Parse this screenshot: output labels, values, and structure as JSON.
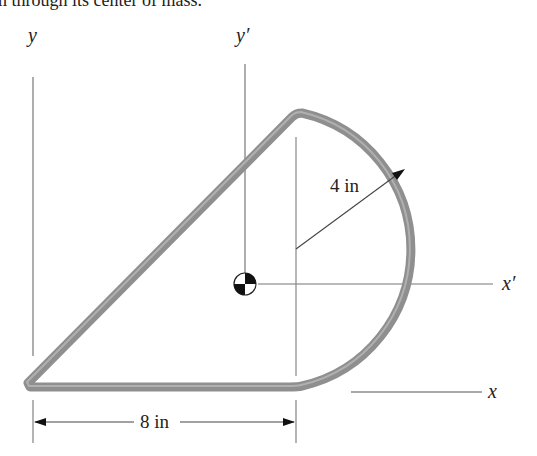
{
  "caption": "h through its center of mass.",
  "figure": {
    "axes": {
      "y": "y",
      "y_prime": "y′",
      "x": "x",
      "x_prime": "x′"
    },
    "dimensions": {
      "radius": "4 in",
      "width": "8 in"
    },
    "symbols": {
      "centroid": "center-of-mass-symbol"
    }
  }
}
